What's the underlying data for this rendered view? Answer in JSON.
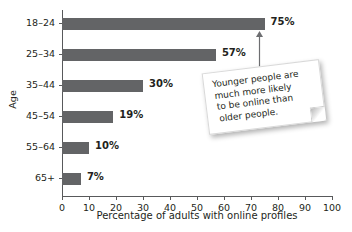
{
  "chart_data": {
    "type": "bar",
    "orientation": "horizontal",
    "title": "",
    "xlabel": "Percentage of adults with online profiles",
    "ylabel": "Age",
    "categories": [
      "18–24",
      "25–34",
      "35–44",
      "45–54",
      "55–64",
      "65+"
    ],
    "values": [
      75,
      57,
      30,
      19,
      10,
      7
    ],
    "value_labels": [
      "75%",
      "57%",
      "30%",
      "19%",
      "10%",
      "7%"
    ],
    "xlim": [
      0,
      100
    ],
    "xticks": [
      0,
      10,
      20,
      30,
      40,
      50,
      60,
      70,
      80,
      90,
      100
    ],
    "xtick_labels": [
      "0",
      "10",
      "20",
      "30",
      "40",
      "50",
      "60",
      "70",
      "80",
      "90",
      "100"
    ],
    "grid": false,
    "legend": null,
    "bar_color": "#636466",
    "axis_color": "#58595b",
    "text_color": "#231f20",
    "background": "#ffffff",
    "annotations": [
      {
        "name": "callout-note",
        "lines": [
          "Younger people are",
          "much more likely",
          "to be online than",
          "older people."
        ],
        "text": "Younger people are much more likely to be online than older people.",
        "points_to_category": "18–24",
        "arrow": "up-arrow"
      }
    ]
  },
  "icons": {
    "arrow": "up-arrow-icon"
  }
}
